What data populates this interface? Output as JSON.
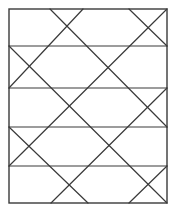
{
  "diagram": {
    "horizontal_bands": 5,
    "diagonal_count": 9,
    "stroke_color": "#3a3a3a",
    "background_color": "#ffffff"
  }
}
